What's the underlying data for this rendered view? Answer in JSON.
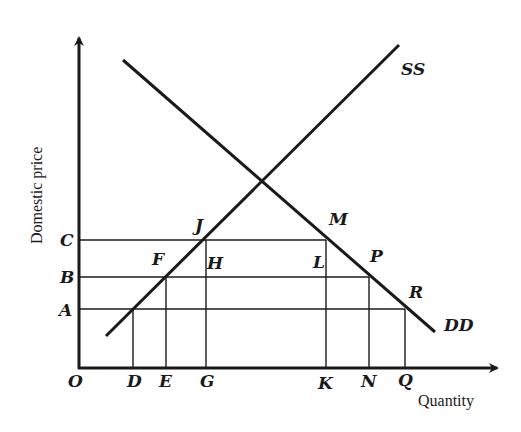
{
  "diagram": {
    "y_axis_label": "Domestic price",
    "x_axis_label": "Quantity",
    "origin_label": "O",
    "curves": {
      "supply": "SS",
      "demand": "DD"
    },
    "price_levels": [
      "C",
      "B",
      "A"
    ],
    "quantity_marks": [
      "D",
      "E",
      "G",
      "K",
      "N",
      "Q"
    ],
    "points": {
      "J": "J",
      "M": "M",
      "F": "F",
      "H": "H",
      "L": "L",
      "P": "P",
      "R": "R"
    },
    "colors": {
      "ink": "#1a1a1a",
      "background": "#ffffff"
    }
  }
}
